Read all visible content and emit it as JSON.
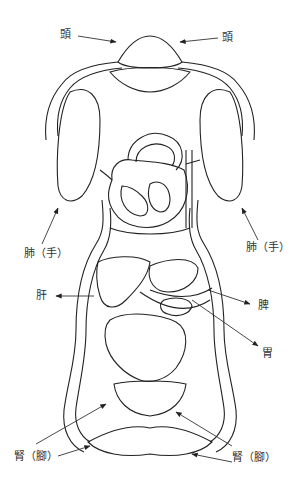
{
  "labels": {
    "head_left": "頭",
    "head_right": "頭",
    "lung_left": "肺（手）",
    "lung_right": "肺（手）",
    "liver": "肝",
    "spleen": "脾",
    "stomach": "胃",
    "kidney_left": "腎（腳）",
    "kidney_right": "腎（腳）"
  },
  "colors": {
    "line": "#222222",
    "text": "#333333",
    "background": "#ffffff"
  }
}
